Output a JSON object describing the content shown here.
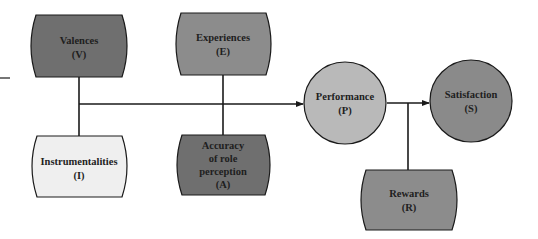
{
  "diagram": {
    "colors": {
      "dark": "#6f6f6f",
      "medium": "#8c8c8c",
      "light": "#efefef",
      "circle_light": "#b9b9b9",
      "circle_dark": "#8a8a8a",
      "line": "#1a1a1a"
    },
    "nodes": {
      "valences": {
        "label": "Valences",
        "abbr": "(V)"
      },
      "experiences": {
        "label": "Experiences",
        "abbr": "(E)"
      },
      "instrumentalities": {
        "label": "Instrumentalities",
        "abbr": "(I)"
      },
      "accuracy": {
        "line1": "Accuracy",
        "line2": "of role",
        "line3": "perception",
        "abbr": "(A)"
      },
      "performance": {
        "label": "Performance",
        "abbr": "(P)"
      },
      "satisfaction": {
        "label": "Satisfaction",
        "abbr": "(S)"
      },
      "rewards": {
        "label": "Rewards",
        "abbr": "(R)"
      }
    },
    "edges": [
      {
        "from": "valences",
        "to": "performance"
      },
      {
        "from": "instrumentalities",
        "to": "performance"
      },
      {
        "from": "experiences",
        "to": "performance"
      },
      {
        "from": "accuracy",
        "to": "performance"
      },
      {
        "from": "performance",
        "to": "satisfaction"
      },
      {
        "from": "rewards",
        "to": "satisfaction"
      }
    ]
  }
}
